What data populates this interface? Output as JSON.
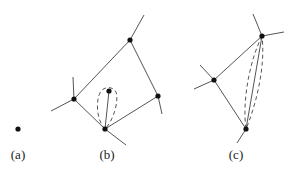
{
  "figure": {
    "panels": [
      {
        "id": "a",
        "label": "(a)",
        "label_pos": [
          18,
          155
        ]
      },
      {
        "id": "b",
        "label": "(b)",
        "label_pos": [
          107,
          155
        ]
      },
      {
        "id": "c",
        "label": "(c)",
        "label_pos": [
          236,
          155
        ]
      }
    ],
    "colors": {
      "edge": "#555555",
      "node": "#111111",
      "dashed": "#555555",
      "background": "#ffffff"
    },
    "nodes": {
      "a": [
        [
          18,
          129
        ]
      ],
      "b": [
        [
          130,
          40
        ],
        [
          74,
          99
        ],
        [
          158,
          96
        ],
        [
          105,
          129
        ],
        [
          109,
          91
        ]
      ],
      "c": [
        [
          262,
          36
        ],
        [
          214,
          80
        ],
        [
          246,
          129
        ]
      ]
    },
    "edges": {
      "b": [
        [
          [
            74,
            99
          ],
          [
            130,
            40
          ]
        ],
        [
          [
            130,
            40
          ],
          [
            158,
            96
          ]
        ],
        [
          [
            158,
            96
          ],
          [
            105,
            129
          ]
        ],
        [
          [
            105,
            129
          ],
          [
            74,
            99
          ]
        ],
        [
          [
            105,
            129
          ],
          [
            109,
            91
          ]
        ],
        [
          [
            130,
            40
          ],
          [
            144,
            15
          ]
        ],
        [
          [
            74,
            99
          ],
          [
            73,
            77
          ]
        ],
        [
          [
            74,
            99
          ],
          [
            51,
            111
          ]
        ],
        [
          [
            158,
            96
          ],
          [
            162,
            114
          ]
        ],
        [
          [
            105,
            129
          ],
          [
            126,
            145
          ]
        ]
      ],
      "c": [
        [
          [
            214,
            80
          ],
          [
            262,
            36
          ]
        ],
        [
          [
            214,
            80
          ],
          [
            246,
            129
          ]
        ],
        [
          [
            262,
            36
          ],
          [
            246,
            129
          ]
        ],
        [
          [
            262,
            36
          ],
          [
            253,
            14
          ]
        ],
        [
          [
            262,
            36
          ],
          [
            284,
            32
          ]
        ],
        [
          [
            214,
            80
          ],
          [
            200,
            65
          ]
        ],
        [
          [
            214,
            80
          ],
          [
            194,
            89
          ]
        ],
        [
          [
            246,
            129
          ],
          [
            237,
            143
          ]
        ]
      ]
    }
  }
}
